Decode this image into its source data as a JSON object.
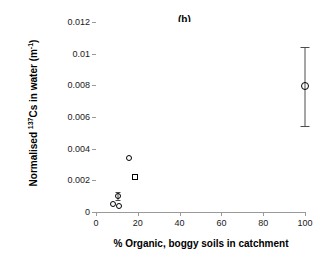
{
  "chart_data": {
    "type": "scatter",
    "title": "(b)",
    "xlabel": "% Organic, boggy soils in catchment",
    "ylabel": "Normalised 137Cs in water (m-1)",
    "ylabel_parts": {
      "prefix": "Normalised ",
      "isotope_sup": "137",
      "middle": "Cs in water (m",
      "unit_sup": "-1",
      "suffix": ")"
    },
    "xlim": [
      0,
      100
    ],
    "ylim": [
      0,
      0.012
    ],
    "xticks": [
      0,
      20,
      40,
      60,
      80,
      100
    ],
    "xtick_labels": [
      "0",
      "20",
      "40",
      "60",
      "80",
      "100"
    ],
    "yticks": [
      0,
      0.002,
      0.004,
      0.006,
      0.008,
      0.01,
      0.012
    ],
    "ytick_labels": [
      "0",
      "0.002",
      "0.004",
      "0.006",
      "0.008",
      "0.01",
      "0.012"
    ],
    "grid": false,
    "legend": false,
    "marker_color": "#000000",
    "marker_fill": "none",
    "axis_color": "#9a9a9a",
    "points": [
      {
        "x": 8.0,
        "y": 0.00048,
        "marker": "circle",
        "yerr": null
      },
      {
        "x": 10.5,
        "y": 0.001,
        "marker": "circle",
        "yerr": 0.00026
      },
      {
        "x": 11.0,
        "y": 0.0004,
        "marker": "circle",
        "yerr": null
      },
      {
        "x": 16.0,
        "y": 0.00338,
        "marker": "circle",
        "yerr": null
      },
      {
        "x": 18.5,
        "y": 0.0022,
        "marker": "square",
        "yerr": null
      },
      {
        "x": 100.0,
        "y": 0.00795,
        "marker": "circle",
        "yerr_low": 0.0025,
        "yerr_high": 0.00245
      }
    ]
  }
}
